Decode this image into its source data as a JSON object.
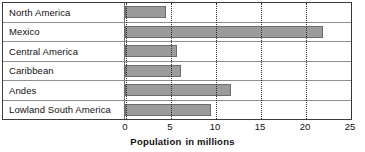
{
  "chart_data": {
    "type": "bar",
    "orientation": "horizontal",
    "title": "",
    "xlabel": "Population  in millions",
    "ylabel": "",
    "categories": [
      "North America",
      "Mexico",
      "Central America",
      "Caribbean",
      "Andes",
      "Lowland South America"
    ],
    "values": [
      4.5,
      22.0,
      5.8,
      6.2,
      11.8,
      9.5
    ],
    "xlim": [
      0,
      25
    ],
    "xticks": [
      0,
      5,
      10,
      15,
      20,
      25
    ],
    "xtick_labels": [
      "0",
      "5",
      "10",
      "15",
      "20",
      "25"
    ],
    "grid": "vertical-dotted",
    "legend": "none",
    "bar_color": "#9b9b9b",
    "bar_edge_color": "#6d6d6d",
    "gridline_color": "#2e2e2e",
    "frame_color": "#3c3c3c",
    "row_separator_color": "#8d8d8d"
  },
  "axis": {
    "title_part_1": "Population",
    "title_part_2": "in millions"
  }
}
